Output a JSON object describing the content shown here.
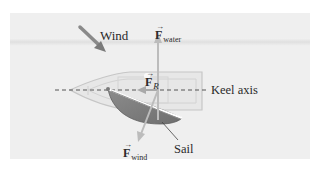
{
  "figure": {
    "type": "physics-free-body-diagram",
    "labels": {
      "wind": "Wind",
      "keel_axis": "Keel axis",
      "sail": "Sail"
    },
    "vectors": {
      "f_water": {
        "symbol": "F",
        "subscript": "water",
        "direction": "up (perpendicular to keel)"
      },
      "f_r": {
        "symbol": "F",
        "subscript": "R",
        "direction": "left (forward along keel)"
      },
      "f_wind": {
        "symbol": "F",
        "subscript": "wind",
        "direction": "down-left (perpendicular to sail)"
      }
    },
    "colors": {
      "panel_bg": "#eeeeee",
      "panel_band": "#e2e2e2",
      "hull_fill": "#e6e6e6",
      "hull_stroke": "#c8c8c8",
      "arrow": "#bcbcbc",
      "wind_arrow": "#8a8a8a",
      "sail_fill": "#7d7d7d",
      "sail_edge": "#5f5f5f",
      "keel_line": "#555555",
      "text": "#2a2a2a"
    }
  }
}
